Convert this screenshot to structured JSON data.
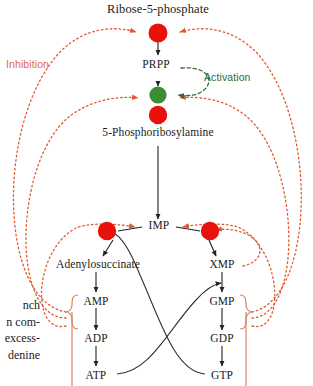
{
  "diagram": {
    "type": "biochemical-pathway",
    "colors": {
      "inhibition": "#DE5A2E",
      "inhibition_label": "#DE6A45",
      "activation": "#2F6B33",
      "activation_node": "#3A8C35",
      "inhibition_node": "#E8110C",
      "arrow": "#222222",
      "bracket": "#E08060"
    },
    "legend": {
      "inhibition": "Inhibition",
      "activation": "Activation"
    },
    "metabolites": {
      "ribose5p": "Ribose-5-phosphate",
      "prpp": "PRPP",
      "pra": "5-Phosphoribosylamine",
      "imp": "IMP",
      "adenylosuccinate": "Adenylosuccinate",
      "xmp": "XMP",
      "amp": "AMP",
      "adp": "ADP",
      "atp": "ATP",
      "gmp": "GMP",
      "gdp": "GDP",
      "gtp": "GTP"
    },
    "side_note_lines": [
      "nch",
      "n com-",
      "excess-",
      "denine"
    ]
  }
}
